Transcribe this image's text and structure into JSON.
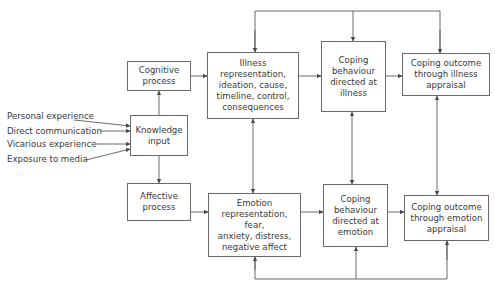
{
  "diagram": {
    "type": "flowchart",
    "inputs": [
      {
        "id": "personal",
        "label": "Personal experience"
      },
      {
        "id": "direct",
        "label": "Direct communication"
      },
      {
        "id": "vicarious",
        "label": "Vicarious experience"
      },
      {
        "id": "media",
        "label": "Exposure to media"
      }
    ],
    "nodes": {
      "knowledge": {
        "label": "Knowledge\ninput"
      },
      "cognitive": {
        "label": "Cognitive\nprocess"
      },
      "affective": {
        "label": "Affective\nprocess"
      },
      "illness_rep": {
        "label": "Illness\nrepresentation,\nideation, cause,\ntimeline, control,\nconsequences"
      },
      "emotion_rep": {
        "label": "Emotion\nrepresentation, fear,\nanxiety, distress,\nnegative affect"
      },
      "coping_illness": {
        "label": "Coping\nbehaviour\ndirected at\nillness"
      },
      "coping_emotion": {
        "label": "Coping\nbehaviour\ndirected at\nemotion"
      },
      "outcome_illness": {
        "label": "Coping outcome\nthrough illness\nappraisal"
      },
      "outcome_emotion": {
        "label": "Coping outcome\nthrough emotion\nappraisal"
      }
    },
    "edges": [
      {
        "from": "personal",
        "to": "knowledge"
      },
      {
        "from": "direct",
        "to": "knowledge"
      },
      {
        "from": "vicarious",
        "to": "knowledge"
      },
      {
        "from": "media",
        "to": "knowledge"
      },
      {
        "from": "knowledge",
        "to": "cognitive"
      },
      {
        "from": "knowledge",
        "to": "affective"
      },
      {
        "from": "cognitive",
        "to": "illness_rep"
      },
      {
        "from": "affective",
        "to": "emotion_rep"
      },
      {
        "from": "illness_rep",
        "to": "coping_illness"
      },
      {
        "from": "coping_illness",
        "to": "outcome_illness"
      },
      {
        "from": "emotion_rep",
        "to": "coping_emotion"
      },
      {
        "from": "coping_emotion",
        "to": "outcome_emotion"
      },
      {
        "from": "illness_rep",
        "to": "emotion_rep",
        "bidirectional": true
      },
      {
        "from": "coping_illness",
        "to": "coping_emotion",
        "bidirectional": true
      },
      {
        "from": "outcome_illness",
        "to": "outcome_emotion",
        "bidirectional": true
      },
      {
        "from": "outcome_illness",
        "to": [
          "illness_rep",
          "coping_illness"
        ],
        "feedback": "top"
      },
      {
        "from": "outcome_emotion",
        "to": [
          "emotion_rep",
          "coping_emotion"
        ],
        "feedback": "bottom"
      }
    ],
    "colors": {
      "line": "#5a5a5a",
      "box_border": "#6a6a6a",
      "text": "#3a3a3a",
      "background": "#ffffff"
    }
  }
}
